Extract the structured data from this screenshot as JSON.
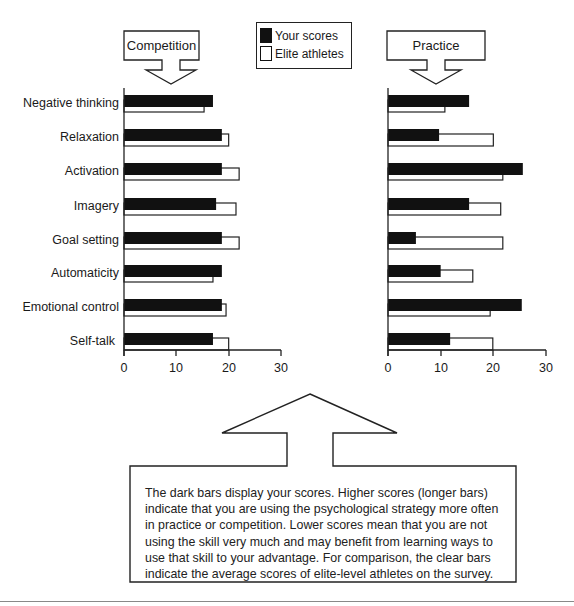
{
  "legend": {
    "your_scores": "Your scores",
    "elite_athletes": "Elite athletes"
  },
  "panels": {
    "competition": {
      "label": "Competition"
    },
    "practice": {
      "label": "Practice"
    }
  },
  "categories": [
    "Negative thinking",
    "Relaxation",
    "Activation",
    "Imagery",
    "Goal setting",
    "Automaticity",
    "Emotional control",
    "Self-talk"
  ],
  "axis": {
    "ticks": [
      "0",
      "10",
      "20",
      "30"
    ]
  },
  "note": "The dark bars display your scores. Higher scores (longer bars) indicate that you are using the psychological strategy more often in practice or competition. Lower scores mean that you are not using the skill very much and may benefit from learning ways to use that skill to your advantage. For comparison, the clear bars indicate the average scores of elite-level athletes on the survey.",
  "colors": {
    "dark_bar": "#111111",
    "clear_bar": "#ffffff",
    "outline": "#222222"
  },
  "chart_data": [
    {
      "type": "bar",
      "orientation": "horizontal",
      "title": "Competition",
      "categories": [
        "Negative thinking",
        "Relaxation",
        "Activation",
        "Imagery",
        "Goal setting",
        "Automaticity",
        "Emotional control",
        "Self-talk"
      ],
      "series": [
        {
          "name": "Your scores",
          "values": [
            17,
            18.7,
            18.7,
            17.6,
            18.7,
            18.7,
            18.7,
            17
          ]
        },
        {
          "name": "Elite athletes",
          "values": [
            15.3,
            20,
            22,
            21.4,
            22,
            17,
            19.5,
            20
          ]
        }
      ],
      "xlabel": "",
      "ylabel": "",
      "xlim": [
        0,
        30
      ],
      "xticks": [
        0,
        10,
        20,
        30
      ],
      "grid": false,
      "legend_position": "top-center"
    },
    {
      "type": "bar",
      "orientation": "horizontal",
      "title": "Practice",
      "categories": [
        "Negative thinking",
        "Relaxation",
        "Activation",
        "Imagery",
        "Goal setting",
        "Automaticity",
        "Emotional control",
        "Self-talk"
      ],
      "series": [
        {
          "name": "Your scores",
          "values": [
            15.4,
            9.7,
            25.6,
            15.4,
            5.3,
            10,
            25.4,
            11.8
          ]
        },
        {
          "name": "Elite athletes",
          "values": [
            10.8,
            20,
            21.8,
            21.4,
            21.8,
            16.1,
            19.4,
            19.9
          ]
        }
      ],
      "xlabel": "",
      "ylabel": "",
      "xlim": [
        0,
        30
      ],
      "xticks": [
        0,
        10,
        20,
        30
      ],
      "grid": false,
      "legend_position": "top-center"
    }
  ]
}
